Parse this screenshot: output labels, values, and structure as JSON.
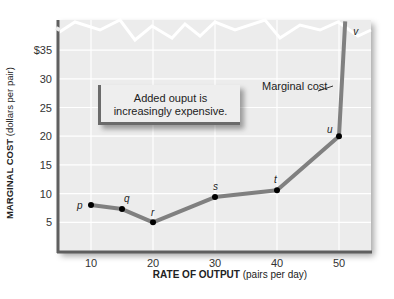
{
  "chart_data": {
    "type": "line",
    "title": "",
    "xlabel": "RATE OF OUTPUT (pairs per day)",
    "xlabel_bold": "RATE OF OUTPUT",
    "xlabel_unit": "(pairs per day)",
    "ylabel": "MARGINAL COST (dollars per pair)",
    "ylabel_bold": "MARGINAL COST",
    "ylabel_unit": "(dollars per pair)",
    "xlim": [
      5,
      56
    ],
    "ylim": [
      0,
      40
    ],
    "grid": true,
    "x_ticks": [
      "10",
      "20",
      "30",
      "40",
      "50"
    ],
    "y_ticks": [
      "5",
      "10",
      "15",
      "20",
      "25",
      "30",
      "$35"
    ],
    "series": [
      {
        "name": "Marginal cost",
        "points": [
          {
            "label": "p",
            "x": 10,
            "y": 8
          },
          {
            "label": "q",
            "x": 15,
            "y": 7.3
          },
          {
            "label": "r",
            "x": 20,
            "y": 5
          },
          {
            "label": "s",
            "x": 30,
            "y": 9.4
          },
          {
            "label": "t",
            "x": 40,
            "y": 10.6
          },
          {
            "label": "u",
            "x": 50,
            "y": 20
          },
          {
            "label": "v",
            "x": 51,
            "y": 40
          }
        ]
      }
    ],
    "annotations": [
      {
        "text": "Added ouput is increasingly expensive."
      },
      {
        "text": "Marginal cost",
        "target": "curve"
      }
    ],
    "axis_break": "zigzag break near top of y-axis above $35"
  },
  "note": {
    "line1": "Added ouput is",
    "line2": "increasingly expensive."
  },
  "curve_label": "Marginal cost",
  "colors": {
    "plot_bg": "#ececec",
    "grid": "#ffffff",
    "curve": "#808080",
    "axis": "#5f5f5f",
    "point": "#000000"
  }
}
